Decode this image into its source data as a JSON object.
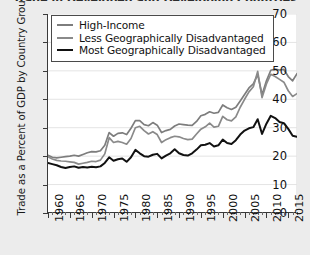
{
  "chart_data": {
    "type": "line",
    "title": "Trade in Developed and Developing Countries",
    "xlabel": "",
    "ylabel": "Trade as a Percent of GDP by Country Group",
    "xlim": [
      1960,
      2017
    ],
    "ylim": [
      0,
      70
    ],
    "yticks": [
      0,
      10,
      20,
      30,
      40,
      50,
      60,
      70
    ],
    "xticks": [
      1960,
      1965,
      1970,
      1975,
      1980,
      1985,
      1990,
      1995,
      2000,
      2005,
      2010,
      2015
    ],
    "xtick_labels": [
      "1960",
      "1965",
      "1970",
      "1975",
      "1980",
      "1985",
      "1990",
      "1995",
      "2000",
      "2005",
      "2010",
      "2015"
    ],
    "minor_xtick_interval": 1,
    "grid": true,
    "legend_position": "top-left",
    "x": [
      1960,
      1961,
      1962,
      1963,
      1964,
      1965,
      1966,
      1967,
      1968,
      1969,
      1970,
      1971,
      1972,
      1973,
      1974,
      1975,
      1976,
      1977,
      1978,
      1979,
      1980,
      1981,
      1982,
      1983,
      1984,
      1985,
      1986,
      1987,
      1988,
      1989,
      1990,
      1991,
      1992,
      1993,
      1994,
      1995,
      1996,
      1997,
      1998,
      1999,
      2000,
      2001,
      2002,
      2003,
      2004,
      2005,
      2006,
      2007,
      2008,
      2009,
      2010,
      2011,
      2012,
      2013,
      2014,
      2015,
      2016,
      2017
    ],
    "series": [
      {
        "name": "High-Income",
        "color": "#7d7d7d",
        "values": [
          20.3,
          19.6,
          19.4,
          19.6,
          19.8,
          20.0,
          20.3,
          20.0,
          20.6,
          21.2,
          21.6,
          21.5,
          21.9,
          23.8,
          28.3,
          27.0,
          28.0,
          28.2,
          27.6,
          29.8,
          32.5,
          32.5,
          31.1,
          30.7,
          31.8,
          30.9,
          28.3,
          29.0,
          29.4,
          30.6,
          31.3,
          31.1,
          30.9,
          30.8,
          32.2,
          34.2,
          34.7,
          35.6,
          35.1,
          35.4,
          38.0,
          37.0,
          36.4,
          37.2,
          39.4,
          41.7,
          44.0,
          45.4,
          48.7,
          41.6,
          46.5,
          50.2,
          50.6,
          50.3,
          50.5,
          48.0,
          46.5,
          49.0
        ]
      },
      {
        "name": "Less Geographically Disadvantaged",
        "color": "#8a8a8a",
        "values": [
          19.8,
          19.0,
          18.5,
          18.3,
          18.2,
          18.0,
          17.8,
          17.2,
          17.5,
          17.8,
          18.2,
          18.1,
          18.6,
          20.8,
          26.5,
          24.8,
          25.2,
          24.8,
          24.2,
          26.2,
          30.0,
          30.5,
          29.0,
          27.8,
          28.6,
          27.6,
          24.8,
          25.8,
          26.5,
          27.0,
          26.8,
          26.2,
          25.8,
          26.0,
          27.8,
          29.5,
          30.3,
          31.6,
          30.2,
          30.5,
          34.0,
          32.8,
          32.4,
          33.8,
          37.2,
          40.0,
          42.6,
          44.4,
          49.8,
          40.6,
          45.4,
          48.8,
          48.0,
          47.0,
          46.0,
          43.0,
          41.0,
          42.0
        ]
      },
      {
        "name": "Most Geographically Disadvantaged",
        "color": "#111111",
        "values": [
          17.6,
          17.2,
          16.8,
          16.2,
          15.8,
          16.2,
          16.4,
          15.9,
          16.2,
          16.0,
          16.3,
          16.1,
          16.4,
          17.6,
          19.6,
          18.4,
          18.9,
          19.2,
          18.0,
          19.6,
          22.2,
          21.0,
          20.0,
          19.8,
          20.5,
          20.8,
          19.2,
          20.2,
          21.0,
          22.4,
          21.0,
          20.4,
          20.2,
          21.0,
          22.3,
          23.8,
          24.0,
          24.6,
          23.4,
          23.8,
          25.8,
          24.6,
          24.3,
          25.6,
          27.6,
          29.0,
          29.8,
          30.2,
          33.0,
          27.8,
          31.4,
          34.2,
          33.4,
          32.0,
          31.6,
          29.6,
          27.2,
          26.8
        ]
      }
    ]
  }
}
